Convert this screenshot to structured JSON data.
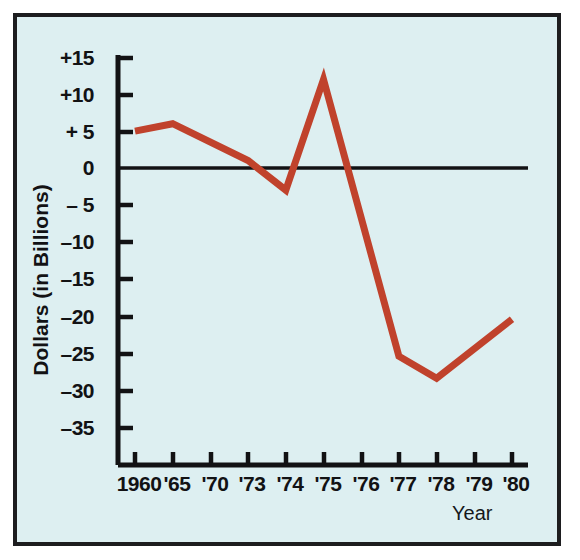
{
  "chart_data": {
    "type": "line",
    "title": "",
    "xlabel": "Year",
    "ylabel": "Dollars (in Billions)",
    "categories": [
      "1960",
      "'65",
      "'70",
      "'73",
      "'74",
      "'75",
      "'76",
      "'77",
      "'78",
      "'79",
      "'80"
    ],
    "values": [
      5,
      6,
      3.5,
      1,
      -3,
      12,
      -10,
      -25.5,
      -28.5,
      -24.5,
      -20.5
    ],
    "vertex_categories": [
      "1960",
      "'65",
      "'73",
      "'74",
      "'75",
      "'77",
      "'78",
      "'80"
    ],
    "vertex_values": [
      5,
      6,
      1,
      -3,
      12,
      -25.5,
      -28.5,
      -20.5
    ],
    "ylim": [
      -37,
      16
    ],
    "yticks": [
      15,
      10,
      5,
      0,
      -5,
      -10,
      -15,
      -20,
      -25,
      -30,
      -35
    ],
    "ytick_labels": [
      "+15",
      "+10",
      "+ 5",
      "0",
      "– 5",
      "–10",
      "–15",
      "–20",
      "–25",
      "–30",
      "–35"
    ],
    "grid": false,
    "legend": "none",
    "zero_line": true,
    "series_color": "#c0422c",
    "axis_color": "#121214",
    "background_color": "#ddeff1"
  },
  "figure": {
    "y_axis_title": "Dollars (in Billions)",
    "x_axis_title": "Year"
  }
}
